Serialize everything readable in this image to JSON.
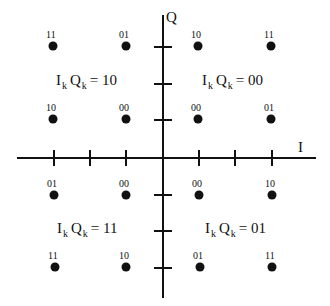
{
  "diagram": {
    "type": "16-QAM constellation diagram",
    "axes": {
      "horizontal_label": "I",
      "vertical_label": "Q"
    },
    "quadrant_labels": [
      {
        "position": "upper-left",
        "prefix_i": "I",
        "sub_i": "k",
        "prefix_q": "Q",
        "sub_q": "k",
        "value": "= 10"
      },
      {
        "position": "upper-right",
        "prefix_i": "I",
        "sub_i": "k",
        "prefix_q": "Q",
        "sub_q": "k",
        "value": "= 00"
      },
      {
        "position": "lower-left",
        "prefix_i": "I",
        "sub_i": "k",
        "prefix_q": "Q",
        "sub_q": "k",
        "value": "= 11"
      },
      {
        "position": "lower-right",
        "prefix_i": "I",
        "sub_i": "k",
        "prefix_q": "Q",
        "sub_q": "k",
        "value": "= 01"
      }
    ],
    "points": [
      {
        "row": 0,
        "col": 0,
        "bits": "11"
      },
      {
        "row": 0,
        "col": 1,
        "bits": "01"
      },
      {
        "row": 0,
        "col": 2,
        "bits": "10"
      },
      {
        "row": 0,
        "col": 3,
        "bits": "11"
      },
      {
        "row": 1,
        "col": 0,
        "bits": "10"
      },
      {
        "row": 1,
        "col": 1,
        "bits": "00"
      },
      {
        "row": 1,
        "col": 2,
        "bits": "00"
      },
      {
        "row": 1,
        "col": 3,
        "bits": "01"
      },
      {
        "row": 2,
        "col": 0,
        "bits": "01"
      },
      {
        "row": 2,
        "col": 1,
        "bits": "00"
      },
      {
        "row": 2,
        "col": 2,
        "bits": "00"
      },
      {
        "row": 2,
        "col": 3,
        "bits": "10"
      },
      {
        "row": 3,
        "col": 0,
        "bits": "11"
      },
      {
        "row": 3,
        "col": 1,
        "bits": "10"
      },
      {
        "row": 3,
        "col": 2,
        "bits": "01"
      },
      {
        "row": 3,
        "col": 3,
        "bits": "11"
      }
    ],
    "i_axis_ticks": 6,
    "q_axis_ticks": 6
  }
}
